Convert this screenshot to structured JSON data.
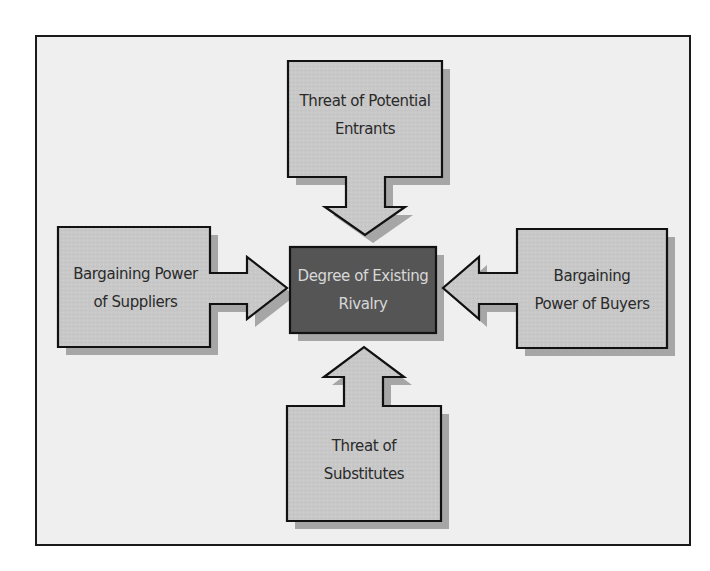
{
  "diagram": {
    "title": "",
    "colors": {
      "background": "#efefef",
      "frame_border": "#1a1a1a",
      "box_fill": "#c8c8c8",
      "box_shadow": "#a6a6a6",
      "center_fill": "#555555",
      "center_text": "#d8d8d8",
      "text": "#2a2a2a"
    },
    "center": {
      "label": "Degree of Existing Rivalry",
      "line1": "Degree of Existing",
      "line2": "Rivalry"
    },
    "forces": {
      "top": {
        "label": "Threat of Potential Entrants",
        "line1": "Threat of Potential",
        "line2": "Entrants",
        "arrow_direction": "down"
      },
      "left": {
        "label": "Bargaining Power of Suppliers",
        "line1": "Bargaining Power",
        "line2": "of Suppliers",
        "arrow_direction": "right"
      },
      "right": {
        "label": "Bargaining Power of Buyers",
        "line1": "Bargaining",
        "line2": "Power of Buyers",
        "arrow_direction": "left"
      },
      "bottom": {
        "label": "Threat of Substitutes",
        "line1": "Threat of",
        "line2": "Substitutes",
        "arrow_direction": "up"
      }
    }
  }
}
